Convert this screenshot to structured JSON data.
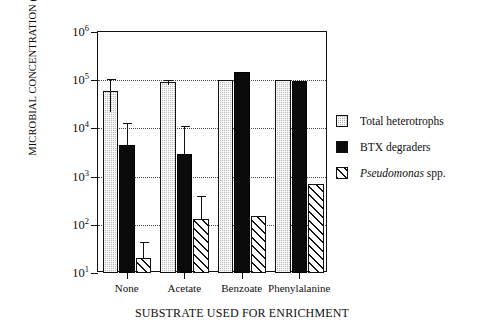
{
  "chart_data": {
    "type": "bar",
    "title": "",
    "xlabel": "SUBSTRATE USED FOR ENRICHMENT",
    "ylabel": "MICROBIAL CONCENTRATION (cells/gram soil)",
    "yscale": "log",
    "ylim": [
      10,
      1000000
    ],
    "ytick_labels": [
      "10",
      "10",
      "10",
      "10",
      "10",
      "10"
    ],
    "ytick_exponents": [
      "6",
      "5",
      "4",
      "3",
      "2",
      "1"
    ],
    "ytick_values": [
      1000000,
      100000,
      10000,
      1000,
      100,
      10
    ],
    "grid": "horizontal-dotted",
    "legend_position": "right",
    "categories": [
      "None",
      "Acetate",
      "Benzoate",
      "Phenylalanine"
    ],
    "series": [
      {
        "name": "Total heterotrophs",
        "fill": "gray-stipple",
        "color": "#b9b9b9",
        "values": [
          60000,
          90000,
          100000,
          100000
        ],
        "errors_high": [
          105000,
          100000,
          null,
          null
        ],
        "errors_low": [
          22000,
          80000,
          null,
          null
        ]
      },
      {
        "name": "BTX degraders",
        "fill": "solid-black",
        "color": "#0b0b0b",
        "values": [
          4500,
          3000,
          150000,
          95000
        ],
        "errors_high": [
          13000,
          11000,
          null,
          null
        ],
        "errors_low": [
          4500,
          3000,
          null,
          null
        ]
      },
      {
        "name": "Pseudomonas spp.",
        "fill": "diagonal-hatch",
        "color": "#ffffff",
        "values": [
          20,
          130,
          150,
          700
        ],
        "errors_high": [
          45,
          400,
          null,
          null
        ],
        "errors_low": [
          20,
          130,
          null,
          null
        ]
      }
    ]
  },
  "legend": {
    "items": [
      {
        "label": "Total heterotrophs",
        "label_italic": "",
        "label_rest": ""
      },
      {
        "label": "BTX degraders",
        "label_italic": "",
        "label_rest": ""
      },
      {
        "label": "Pseudomonas spp.",
        "label_italic": "Pseudomonas",
        "label_rest": " spp."
      }
    ]
  }
}
